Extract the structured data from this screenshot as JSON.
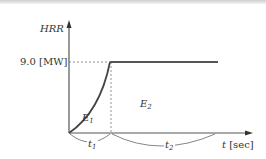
{
  "diagram": {
    "y_axis_label": "HRR",
    "x_axis_label_var": "t",
    "x_axis_label_unit": "[sec]",
    "plateau_label": "9.0 [MW]",
    "region_1": {
      "var": "E",
      "sub": "1"
    },
    "region_2": {
      "var": "E",
      "sub": "2"
    },
    "interval_1": {
      "var": "t",
      "sub": "1"
    },
    "interval_2": {
      "var": "t",
      "sub": "2"
    },
    "colors": {
      "curve": "#4a4a4a",
      "axis": "#555555",
      "dashed": "#777777"
    }
  }
}
